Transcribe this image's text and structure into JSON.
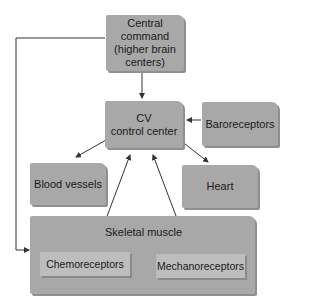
{
  "diagram": {
    "nodes": {
      "central_command": "Central command (higher brain centers)",
      "central_command_lines": [
        "Central",
        "command",
        "(higher brain",
        "centers)"
      ],
      "cv_center_lines": [
        "CV",
        "control center"
      ],
      "baroreceptors": "Baroreceptors",
      "blood_vessels": "Blood vessels",
      "heart": "Heart",
      "skeletal_muscle": "Skeletal muscle",
      "chemoreceptors": "Chemoreceptors",
      "mechanoreceptors": "Mechanoreceptors"
    },
    "edges": [
      {
        "from": "Central command",
        "to": "CV control center"
      },
      {
        "from": "Central command",
        "to": "Skeletal muscle"
      },
      {
        "from": "Baroreceptors",
        "to": "CV control center"
      },
      {
        "from": "CV control center",
        "to": "Blood vessels"
      },
      {
        "from": "CV control center",
        "to": "Heart"
      },
      {
        "from": "Chemoreceptors",
        "to": "CV control center"
      },
      {
        "from": "Mechanoreceptors",
        "to": "CV control center"
      }
    ],
    "colors": {
      "box": "#a8a8a8",
      "sub_box": "#bdbdbd",
      "line": "#333333"
    }
  }
}
